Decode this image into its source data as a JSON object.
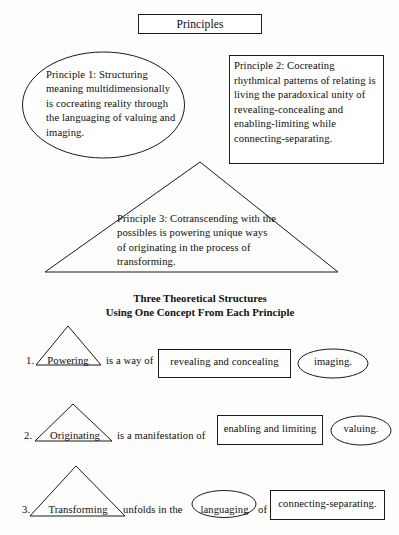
{
  "diagram": {
    "title": "Principles",
    "principle_1": {
      "shape": "ellipse",
      "text": "Principle 1: Structuring meaning multidimensionally is cocreating reality through the languaging of valuing and imaging."
    },
    "principle_2": {
      "shape": "rectangle",
      "text": "Principle 2: Cocreating rhythmical patterns of relating is living the paradoxical unity of revealing-concealing and enabling-limiting while connecting-separating."
    },
    "principle_3": {
      "shape": "triangle",
      "text": "Principle 3: Cotranscending with the possibles is powering unique ways of originating in the process of transforming."
    },
    "section_heading_line1": "Three Theoretical Structures",
    "section_heading_line2": "Using One Concept From Each Principle",
    "structures": [
      {
        "number": "1.",
        "triangle_label": "Powering",
        "connector": "is a way of",
        "rect_label": "revealing and concealing",
        "ellipse_label": "imaging.",
        "tail_connector": ""
      },
      {
        "number": "2.",
        "triangle_label": "Originating",
        "connector": "is a manifestation of",
        "rect_label": "enabling and limiting",
        "ellipse_label": "valuing.",
        "tail_connector": ""
      },
      {
        "number": "3.",
        "triangle_label": "Transforming",
        "connector": "unfolds in the",
        "ellipse_label": "languaging",
        "tail_connector": "of",
        "rect_label": "connecting-separating."
      }
    ]
  },
  "colors": {
    "stroke": "#1a1a1a",
    "text": "#0d0d0d",
    "background": "#fdfdfc"
  }
}
